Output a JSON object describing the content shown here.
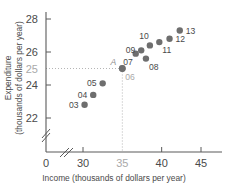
{
  "chart_data": {
    "type": "scatter",
    "title": "",
    "xlabel": "Income (thousands of dollars per year)",
    "ylabel_line1": "Expenditure",
    "ylabel_line2": "(thousands of dollars per year)",
    "xlim": [
      28.6,
      46.5
    ],
    "ylim": [
      21.4,
      28.6
    ],
    "xticks": [
      "0",
      "30",
      "35",
      "40",
      "45"
    ],
    "xtick_values": [
      0,
      30,
      35,
      40,
      45
    ],
    "xtick_muted": [
      false,
      false,
      true,
      false,
      false
    ],
    "yticks": [
      "22",
      "24",
      "25",
      "26",
      "28"
    ],
    "ytick_values": [
      22,
      24,
      25,
      26,
      28
    ],
    "ytick_muted": [
      false,
      false,
      true,
      false,
      false
    ],
    "grid": false,
    "legend": "none",
    "axis_break_x": true,
    "axis_break_y": true,
    "marker_color": "#6e6e6e",
    "guide_color": "#b5b5b5",
    "axis_color": "#5a5a5a",
    "highlight_point": {
      "label": "A",
      "series_label": "06",
      "x": 35,
      "y": 25,
      "guides": true
    },
    "points": [
      {
        "label": "03",
        "x": 30.2,
        "y": 22.8,
        "label_pos": "left"
      },
      {
        "label": "04",
        "x": 31.3,
        "y": 23.4,
        "label_pos": "left"
      },
      {
        "label": "05",
        "x": 32.5,
        "y": 24.1,
        "label_pos": "left"
      },
      {
        "label": "06",
        "x": 35.0,
        "y": 25.0,
        "label_pos": "below-right",
        "muted": true
      },
      {
        "label": "07",
        "x": 36.7,
        "y": 25.9,
        "label_pos": "below-left"
      },
      {
        "label": "08",
        "x": 38.0,
        "y": 25.6,
        "label_pos": "below-right"
      },
      {
        "label": "09",
        "x": 37.4,
        "y": 26.1,
        "label_pos": "left"
      },
      {
        "label": "10",
        "x": 38.5,
        "y": 26.4,
        "label_pos": "above-left"
      },
      {
        "label": "11",
        "x": 39.7,
        "y": 26.6,
        "label_pos": "below-right"
      },
      {
        "label": "12",
        "x": 41.0,
        "y": 26.8,
        "label_pos": "right"
      },
      {
        "label": "13",
        "x": 42.3,
        "y": 27.3,
        "label_pos": "right"
      }
    ]
  }
}
